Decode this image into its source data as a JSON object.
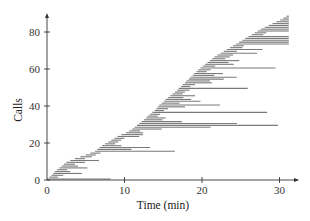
{
  "chart_data": {
    "type": "bar",
    "subtype": "horizontal-interval (Gantt-style) bars: one bar per call from arrival time to departure time",
    "title": "",
    "xlabel": "Time (min)",
    "ylabel": "Calls",
    "xlim": [
      0,
      31.5
    ],
    "ylim": [
      0,
      90
    ],
    "xticks": [
      0,
      10,
      20,
      30
    ],
    "yticks": [
      0,
      20,
      40,
      60,
      80
    ],
    "grid": false,
    "legend": null,
    "axis_arrows": true,
    "bar_color": "#7a7a7a",
    "calls": [
      {
        "id": 0,
        "start": 0.0,
        "end": 8.2
      },
      {
        "id": 1,
        "start": 0.3,
        "end": 1.4
      },
      {
        "id": 2,
        "start": 0.6,
        "end": 2.1
      },
      {
        "id": 3,
        "start": 0.8,
        "end": 4.5
      },
      {
        "id": 4,
        "start": 1.0,
        "end": 3.0
      },
      {
        "id": 5,
        "start": 1.3,
        "end": 2.6
      },
      {
        "id": 6,
        "start": 1.6,
        "end": 5.2
      },
      {
        "id": 7,
        "start": 1.9,
        "end": 4.0
      },
      {
        "id": 8,
        "start": 2.2,
        "end": 3.6
      },
      {
        "id": 9,
        "start": 2.5,
        "end": 4.9
      },
      {
        "id": 10,
        "start": 3.0,
        "end": 6.7
      },
      {
        "id": 11,
        "start": 3.6,
        "end": 4.9
      },
      {
        "id": 12,
        "start": 4.3,
        "end": 5.8
      },
      {
        "id": 13,
        "start": 5.0,
        "end": 6.3
      },
      {
        "id": 14,
        "start": 5.6,
        "end": 6.9
      },
      {
        "id": 15,
        "start": 6.2,
        "end": 16.5
      },
      {
        "id": 16,
        "start": 6.5,
        "end": 10.9
      },
      {
        "id": 17,
        "start": 6.8,
        "end": 13.3
      },
      {
        "id": 18,
        "start": 7.1,
        "end": 9.6
      },
      {
        "id": 19,
        "start": 7.5,
        "end": 8.8
      },
      {
        "id": 20,
        "start": 7.9,
        "end": 9.2
      },
      {
        "id": 21,
        "start": 8.3,
        "end": 9.6
      },
      {
        "id": 22,
        "start": 8.7,
        "end": 10.0
      },
      {
        "id": 23,
        "start": 9.1,
        "end": 11.9
      },
      {
        "id": 24,
        "start": 9.6,
        "end": 12.4
      },
      {
        "id": 25,
        "start": 10.2,
        "end": 12.4
      },
      {
        "id": 26,
        "start": 10.6,
        "end": 12.0
      },
      {
        "id": 27,
        "start": 11.0,
        "end": 14.8
      },
      {
        "id": 28,
        "start": 11.3,
        "end": 21.1
      },
      {
        "id": 29,
        "start": 11.6,
        "end": 29.8
      },
      {
        "id": 30,
        "start": 11.9,
        "end": 24.5
      },
      {
        "id": 31,
        "start": 12.2,
        "end": 17.4
      },
      {
        "id": 32,
        "start": 12.5,
        "end": 14.9
      },
      {
        "id": 33,
        "start": 12.8,
        "end": 15.3
      },
      {
        "id": 34,
        "start": 13.0,
        "end": 14.3
      },
      {
        "id": 35,
        "start": 13.3,
        "end": 14.6
      },
      {
        "id": 36,
        "start": 13.6,
        "end": 28.4
      },
      {
        "id": 37,
        "start": 13.9,
        "end": 15.1
      },
      {
        "id": 38,
        "start": 14.1,
        "end": 15.6
      },
      {
        "id": 39,
        "start": 14.3,
        "end": 17.8
      },
      {
        "id": 40,
        "start": 14.5,
        "end": 22.3
      },
      {
        "id": 41,
        "start": 14.8,
        "end": 17.1
      },
      {
        "id": 42,
        "start": 15.1,
        "end": 19.8
      },
      {
        "id": 43,
        "start": 15.3,
        "end": 18.6
      },
      {
        "id": 44,
        "start": 15.6,
        "end": 17.6
      },
      {
        "id": 45,
        "start": 15.9,
        "end": 19.1
      },
      {
        "id": 46,
        "start": 16.2,
        "end": 17.5
      },
      {
        "id": 47,
        "start": 16.5,
        "end": 17.8
      },
      {
        "id": 48,
        "start": 16.8,
        "end": 18.4
      },
      {
        "id": 49,
        "start": 17.0,
        "end": 25.9
      },
      {
        "id": 50,
        "start": 17.3,
        "end": 18.5
      },
      {
        "id": 51,
        "start": 17.5,
        "end": 19.1
      },
      {
        "id": 52,
        "start": 17.8,
        "end": 21.3
      },
      {
        "id": 53,
        "start": 18.0,
        "end": 21.0
      },
      {
        "id": 54,
        "start": 18.3,
        "end": 22.8
      },
      {
        "id": 55,
        "start": 18.5,
        "end": 24.5
      },
      {
        "id": 56,
        "start": 18.8,
        "end": 21.6
      },
      {
        "id": 57,
        "start": 19.0,
        "end": 22.7
      },
      {
        "id": 58,
        "start": 19.3,
        "end": 20.6
      },
      {
        "id": 59,
        "start": 19.5,
        "end": 21.1
      },
      {
        "id": 60,
        "start": 19.8,
        "end": 29.5
      },
      {
        "id": 61,
        "start": 20.1,
        "end": 21.7
      },
      {
        "id": 62,
        "start": 20.4,
        "end": 24.1
      },
      {
        "id": 63,
        "start": 20.7,
        "end": 23.4
      },
      {
        "id": 64,
        "start": 21.0,
        "end": 24.8
      },
      {
        "id": 65,
        "start": 21.3,
        "end": 23.0
      },
      {
        "id": 66,
        "start": 21.6,
        "end": 23.6
      },
      {
        "id": 67,
        "start": 22.0,
        "end": 24.0
      },
      {
        "id": 68,
        "start": 22.4,
        "end": 27.1
      },
      {
        "id": 69,
        "start": 22.8,
        "end": 24.5
      },
      {
        "id": 70,
        "start": 23.2,
        "end": 27.8
      },
      {
        "id": 71,
        "start": 23.6,
        "end": 25.2
      },
      {
        "id": 72,
        "start": 24.0,
        "end": 25.4
      },
      {
        "id": 73,
        "start": 24.4,
        "end": 31.2
      },
      {
        "id": 74,
        "start": 24.8,
        "end": 31.2
      },
      {
        "id": 75,
        "start": 25.2,
        "end": 31.2
      },
      {
        "id": 76,
        "start": 25.6,
        "end": 31.2
      },
      {
        "id": 77,
        "start": 26.0,
        "end": 31.2
      },
      {
        "id": 78,
        "start": 26.4,
        "end": 27.9
      },
      {
        "id": 79,
        "start": 26.8,
        "end": 28.3
      },
      {
        "id": 80,
        "start": 27.2,
        "end": 31.2
      },
      {
        "id": 81,
        "start": 27.6,
        "end": 31.2
      },
      {
        "id": 82,
        "start": 28.1,
        "end": 31.2
      },
      {
        "id": 83,
        "start": 28.6,
        "end": 31.2
      },
      {
        "id": 84,
        "start": 29.1,
        "end": 31.2
      },
      {
        "id": 85,
        "start": 29.6,
        "end": 31.2
      },
      {
        "id": 86,
        "start": 30.1,
        "end": 31.2
      },
      {
        "id": 87,
        "start": 30.5,
        "end": 31.2
      },
      {
        "id": 88,
        "start": 30.9,
        "end": 31.2
      }
    ]
  },
  "plot": {
    "x_tick_labels": [
      "0",
      "10",
      "20",
      "30"
    ],
    "y_tick_labels": [
      "0",
      "20",
      "40",
      "60",
      "80"
    ],
    "xlabel": "Time (min)",
    "ylabel": "Calls"
  }
}
